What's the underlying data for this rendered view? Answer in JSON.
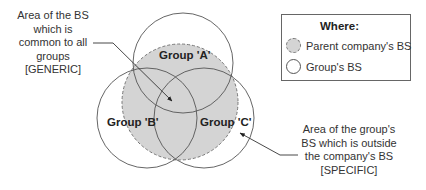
{
  "diagram": {
    "type": "venn",
    "colors": {
      "parent_fill": "#d4d4d4",
      "parent_stroke": "#777777",
      "group_stroke": "#555555",
      "text": "#333333"
    },
    "circles": {
      "parent": {
        "label": "Parent company's BS",
        "style": "dashed-filled"
      },
      "groups": [
        {
          "id": "A",
          "label": "Group 'A'"
        },
        {
          "id": "B",
          "label": "Group 'B'"
        },
        {
          "id": "C",
          "label": "Group 'C'"
        }
      ]
    },
    "annotations": {
      "generic": {
        "lines": [
          "Area of the BS",
          "which is",
          "common to all",
          "groups",
          "[GENERIC]"
        ]
      },
      "specific": {
        "lines": [
          "Area of the group's",
          "BS which is outside",
          "the company's BS",
          "[SPECIFIC]"
        ]
      }
    },
    "legend": {
      "title": "Where:",
      "items": [
        {
          "label": "Parent company's BS",
          "icon": "dashed-shaded-circle-icon"
        },
        {
          "label": "Group's BS",
          "icon": "outline-circle-icon"
        }
      ]
    }
  }
}
